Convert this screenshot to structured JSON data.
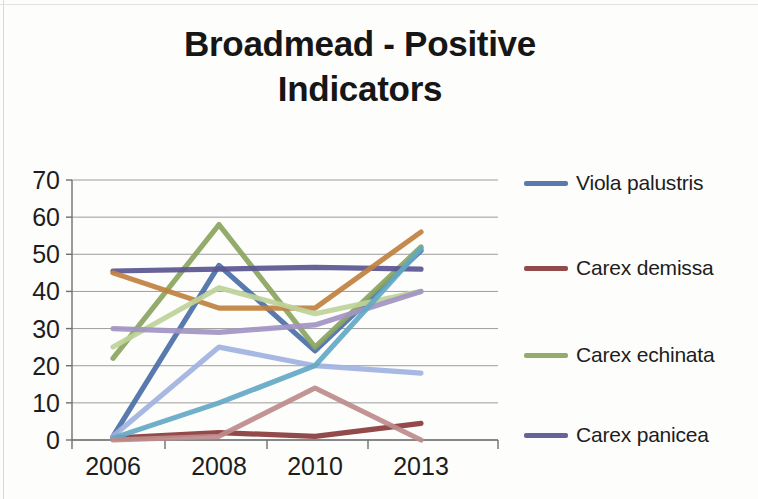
{
  "chart_data": {
    "type": "line",
    "title": "Broadmead - Positive Indicators",
    "title_line1": "Broadmead - Positive",
    "title_line2": "Indicators",
    "xlabel": "",
    "ylabel": "",
    "categories": [
      "2006",
      "2008",
      "2010",
      "2013"
    ],
    "ylim": [
      0,
      70
    ],
    "yticks": [
      0,
      10,
      20,
      30,
      40,
      50,
      60,
      70
    ],
    "grid": true,
    "legend_position": "right",
    "series": [
      {
        "name": "Viola palustris",
        "color": "#4a6fa8",
        "in_legend": true,
        "values": [
          1,
          47,
          24,
          51
        ]
      },
      {
        "name": "Carex demissa",
        "color": "#8a3b3b",
        "in_legend": true,
        "values": [
          0.5,
          2,
          1,
          4.5
        ]
      },
      {
        "name": "Carex echinata",
        "color": "#8aa55f",
        "in_legend": true,
        "values": [
          22,
          58,
          25,
          52
        ]
      },
      {
        "name": "Carex panicea",
        "color": "#5a5590",
        "in_legend": true,
        "values": [
          45.5,
          46,
          46.5,
          46
        ]
      },
      {
        "name": "series-orange",
        "color": "#c0813f",
        "in_legend": false,
        "values": [
          45,
          35.5,
          35.5,
          56
        ]
      },
      {
        "name": "series-pale-green",
        "color": "#bed39a",
        "in_legend": false,
        "values": [
          25,
          41,
          34,
          40
        ]
      },
      {
        "name": "series-lavender",
        "color": "#a394c4",
        "in_legend": false,
        "values": [
          30,
          29,
          31,
          40
        ]
      },
      {
        "name": "series-periwinkle",
        "color": "#9fb3e0",
        "in_legend": false,
        "values": [
          1,
          25,
          20,
          18
        ]
      },
      {
        "name": "series-teal",
        "color": "#63a8c4",
        "in_legend": false,
        "values": [
          0.5,
          10,
          20,
          51.5
        ]
      },
      {
        "name": "series-rose",
        "color": "#bd8b8b",
        "in_legend": false,
        "values": [
          0,
          1,
          14,
          0
        ]
      }
    ]
  },
  "axis": {
    "y_tick_labels": [
      "70",
      "60",
      "50",
      "40",
      "30",
      "20",
      "10",
      "0"
    ],
    "x_tick_labels": [
      "2006",
      "2008",
      "2010",
      "2013"
    ]
  },
  "legend": {
    "items": [
      {
        "label": "Viola palustris",
        "color": "#4a6fa8"
      },
      {
        "label": "Carex demissa",
        "color": "#8a3b3b"
      },
      {
        "label": "Carex echinata",
        "color": "#8aa55f"
      },
      {
        "label": "Carex panicea",
        "color": "#5a5590"
      }
    ]
  }
}
